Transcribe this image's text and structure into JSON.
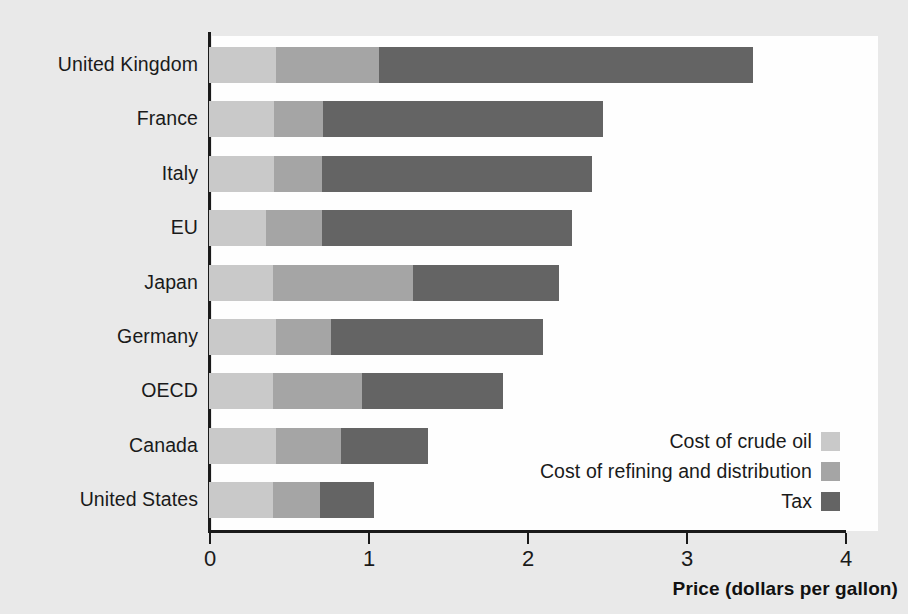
{
  "chart_data": {
    "type": "bar",
    "orientation": "horizontal",
    "stacked": true,
    "title": "",
    "xlabel": "Price (dollars per gallon)",
    "ylabel": "",
    "xlim": [
      0,
      4.2
    ],
    "xticks": [
      "0",
      "1",
      "2",
      "3",
      "4"
    ],
    "xtick_values": [
      0,
      1,
      2,
      3,
      4
    ],
    "grid": false,
    "legend_position": "inside-bottom-right",
    "categories": [
      "United Kingdom",
      "France",
      "Italy",
      "EU",
      "Japan",
      "Germany",
      "OECD",
      "Canada",
      "United States"
    ],
    "series": [
      {
        "name": "Cost of crude oil",
        "color": "#c9c9c9",
        "values": [
          0.42,
          0.41,
          0.41,
          0.36,
          0.4,
          0.42,
          0.4,
          0.42,
          0.4
        ]
      },
      {
        "name": "Cost of refining and distribution",
        "color": "#a5a5a5",
        "values": [
          0.65,
          0.31,
          0.3,
          0.35,
          0.88,
          0.35,
          0.56,
          0.41,
          0.3
        ]
      },
      {
        "name": "Tax",
        "color": "#646464",
        "values": [
          2.35,
          1.76,
          1.7,
          1.57,
          0.92,
          1.33,
          0.89,
          0.55,
          0.34
        ]
      }
    ],
    "totals": [
      3.42,
      2.48,
      2.41,
      2.28,
      2.2,
      2.1,
      1.85,
      1.38,
      1.04
    ]
  },
  "legend": {
    "items": [
      {
        "label": "Cost of crude oil",
        "color": "#c9c9c9"
      },
      {
        "label": "Cost of refining and distribution",
        "color": "#a5a5a5"
      },
      {
        "label": "Tax",
        "color": "#646464"
      }
    ]
  },
  "axis": {
    "x_title": "Price (dollars per gallon)",
    "x_tick_labels": [
      "0",
      "1",
      "2",
      "3",
      "4"
    ]
  },
  "colors": {
    "page_background": "#e9e9e9",
    "plot_background": "#fefefe",
    "axis": "#1a1a1a",
    "text": "#1a1a1a",
    "crude": "#c9c9c9",
    "refining": "#a5a5a5",
    "tax": "#646464"
  }
}
